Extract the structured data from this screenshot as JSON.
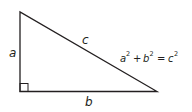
{
  "diagram": {
    "type": "right-triangle",
    "labels": {
      "a": "a",
      "b": "b",
      "c": "c"
    },
    "equation": {
      "a": "a",
      "b": "b",
      "c": "c",
      "exp": "2",
      "plus": "+",
      "equals": "="
    },
    "colors": {
      "stroke": "#231f20",
      "background": "#ffffff"
    }
  }
}
